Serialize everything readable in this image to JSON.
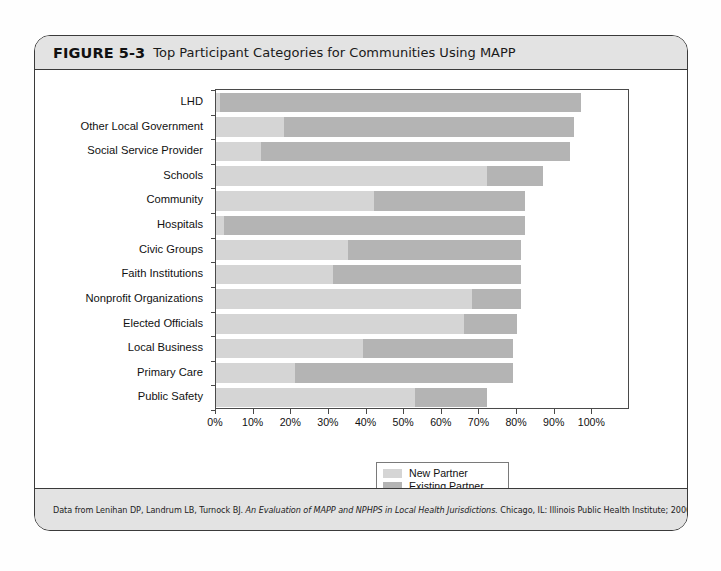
{
  "figure": {
    "number": "FIGURE 5-3",
    "title": "Top Participant Categories for Communities Using MAPP",
    "source_prefix": "Data from Lenihan DP, Landrum LB, Turnock BJ. ",
    "source_italic": "An Evaluation of MAPP and NPHPS in Local Health Jurisdictions.",
    "source_suffix": " Chicago, IL: Illinois Public Health Institute; 2006."
  },
  "legend": {
    "position": "bottom-center",
    "items": [
      {
        "label": "New Partner",
        "color": "#d5d5d5"
      },
      {
        "label": "Existing Partner",
        "color": "#b4b4b4"
      }
    ]
  },
  "axis": {
    "x_ticks": [
      "0%",
      "10%",
      "20%",
      "30%",
      "40%",
      "50%",
      "60%",
      "70%",
      "80%",
      "90%",
      "100%"
    ],
    "x_min": 0,
    "x_max": 110
  },
  "chart_data": {
    "type": "bar",
    "orientation": "horizontal",
    "stacked": true,
    "title": "Top Participant Categories for Communities Using MAPP",
    "xlabel": "",
    "ylabel": "",
    "xlim": [
      0,
      110
    ],
    "grid": false,
    "legend_position": "bottom-center",
    "categories": [
      "LHD",
      "Other Local Government",
      "Social Service Provider",
      "Schools",
      "Community",
      "Hospitals",
      "Civic Groups",
      "Faith Institutions",
      "Nonprofit Organizations",
      "Elected Officials",
      "Local Business",
      "Primary Care",
      "Public Safety"
    ],
    "series": [
      {
        "name": "New Partner",
        "color": "#d5d5d5",
        "values": [
          1,
          18,
          12,
          72,
          42,
          2,
          35,
          31,
          68,
          66,
          39,
          21,
          53
        ]
      },
      {
        "name": "Existing Partner",
        "color": "#b4b4b4",
        "values": [
          96,
          77,
          82,
          15,
          40,
          80,
          46,
          50,
          13,
          14,
          40,
          58,
          19
        ]
      }
    ],
    "totals": [
      97,
      95,
      94,
      87,
      82,
      82,
      81,
      81,
      81,
      80,
      79,
      79,
      72
    ]
  }
}
